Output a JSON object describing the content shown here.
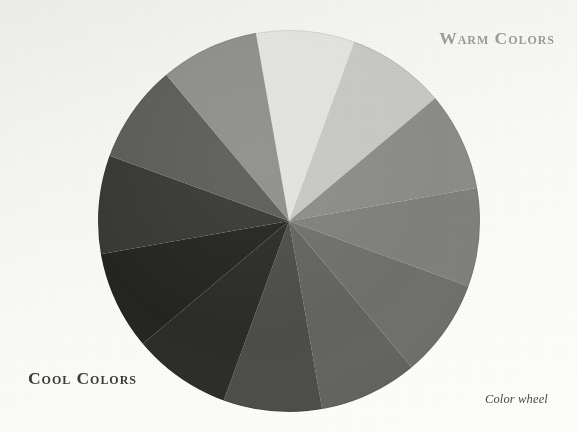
{
  "figure": {
    "title": "Color wheel",
    "background_color": "#f5f5f3",
    "rendering": "grayscale"
  },
  "labels": {
    "warm": "Warm Colors",
    "cool": "Cool Colors",
    "caption": "Color wheel"
  },
  "colors": {
    "warm_label_color": "#9a9a99",
    "cool_label_color": "#3a3a38",
    "caption_color": "#4a4a48",
    "background": "#f5f5f3"
  },
  "chart_data": {
    "type": "pie",
    "title": "Color wheel",
    "grid": false,
    "legend": "none",
    "center_x": 289,
    "center_y": 221,
    "radius": 191,
    "segment_count": 12,
    "segment_degrees": 30,
    "start_angle": -100,
    "categories": [
      "yellow",
      "yellow-orange",
      "orange",
      "red-orange",
      "red",
      "red-violet",
      "violet",
      "blue-violet",
      "blue",
      "blue-green",
      "green",
      "yellow-green"
    ],
    "values": [
      30,
      30,
      30,
      30,
      30,
      30,
      30,
      30,
      30,
      30,
      30,
      30
    ],
    "slice_colors": [
      "#e2e2e0",
      "#c7c7c5",
      "#8b8b88",
      "#7f7f7c",
      "#6f6f6d",
      "#636361",
      "#4c4c4a",
      "#2b2b2a",
      "#242423",
      "#383837",
      "#5c5c5a",
      "#8e8e8c"
    ],
    "groups": [
      {
        "name": "Warm Colors",
        "categories": [
          "yellow",
          "yellow-orange",
          "orange",
          "red-orange",
          "red",
          "red-violet"
        ]
      },
      {
        "name": "Cool Colors",
        "categories": [
          "violet",
          "blue-violet",
          "blue",
          "blue-green",
          "green",
          "yellow-green"
        ]
      }
    ]
  }
}
